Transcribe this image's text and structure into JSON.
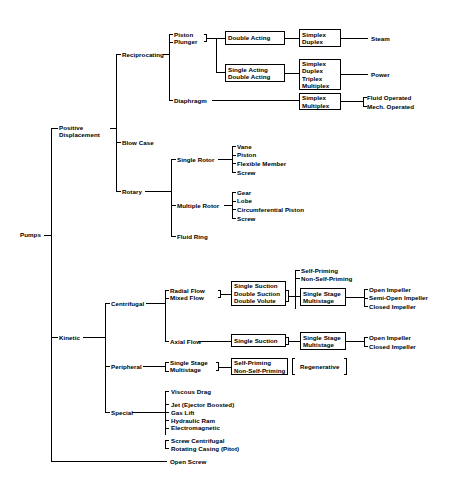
{
  "root": {
    "label": "Pumps"
  },
  "branches": {
    "positive_displacement": "Positive\nDisplacement",
    "kinetic": "Kinetic",
    "open_screw": "Open Screw"
  },
  "positive_displacement": {
    "children": [
      {
        "label": "Reciprocating"
      },
      {
        "label": "Blow Case"
      },
      {
        "label": "Rotary"
      }
    ],
    "reciprocating": {
      "children": [
        {
          "label": "Piston\nPlunger"
        },
        {
          "label": "Diaphragm"
        }
      ],
      "piston_plunger": {
        "boxes": [
          {
            "label": "Double Acting"
          },
          {
            "label": "Single Acting\nDouble Acting"
          }
        ],
        "second_boxes": [
          {
            "label": "Simplex\nDuplex"
          },
          {
            "label": "Simplex\nDuplex\nTriplex\nMultiplex"
          }
        ],
        "terminals": [
          {
            "label": "Steam"
          },
          {
            "label": "Power"
          }
        ]
      },
      "diaphragm": {
        "box": {
          "label": "Simplex\nMultiplex"
        },
        "terminals": [
          {
            "label": "Fluid Operated"
          },
          {
            "label": "Mech. Operated"
          }
        ]
      }
    },
    "rotary": {
      "children": [
        {
          "label": "Single Rotor"
        },
        {
          "label": "Multiple Rotor"
        },
        {
          "label": "Fluid Ring"
        }
      ],
      "single_rotor_types": [
        "Vane",
        "Piston",
        "Flexible Member",
        "Screw"
      ],
      "multiple_rotor_types": [
        "Gear",
        "Lobe",
        "Circumferential Piston",
        "Screw"
      ]
    }
  },
  "kinetic": {
    "children": [
      {
        "label": "Centrifugal"
      },
      {
        "label": "Peripheral"
      },
      {
        "label": "Special"
      }
    ],
    "centrifugal": {
      "flows": [
        {
          "label": "Radial Flow\nMixed Flow"
        },
        {
          "label": "Axial Flow"
        }
      ],
      "radial_mixed": {
        "suction_box": {
          "label": "Single Suction\nDouble Suction\nDouble Volute"
        },
        "priming": [
          "Self-Priming",
          "Non-Self-Priming"
        ],
        "stage_box": {
          "label": "Single Stage\nMultistage"
        },
        "impellers": [
          "Open Impeller",
          "Semi-Open Impeller",
          "Closed Impeller"
        ]
      },
      "axial": {
        "suction_box": {
          "label": "Single Suction"
        },
        "stage_box": {
          "label": "Single Stage\nMultistage"
        },
        "impellers": [
          "Open Impeller",
          "Closed Impeller"
        ]
      }
    },
    "peripheral": {
      "stage": {
        "label": "Single Stage\nMultistage"
      },
      "priming_box": {
        "label": "Self-Priming\nNon-Self-Priming"
      },
      "type_box": {
        "label": "Regenerative"
      }
    },
    "special": {
      "types": [
        "Viscous Drag",
        "Jet (Ejector Boosted)",
        "Gas Lift",
        "Hydraulic Ram",
        "Electromagnetic",
        "Screw Centrifugal",
        "Rotating Casing (Pitot)"
      ]
    }
  },
  "colors": {
    "line": "#000000",
    "background": "#ffffff",
    "text": "#000000"
  }
}
